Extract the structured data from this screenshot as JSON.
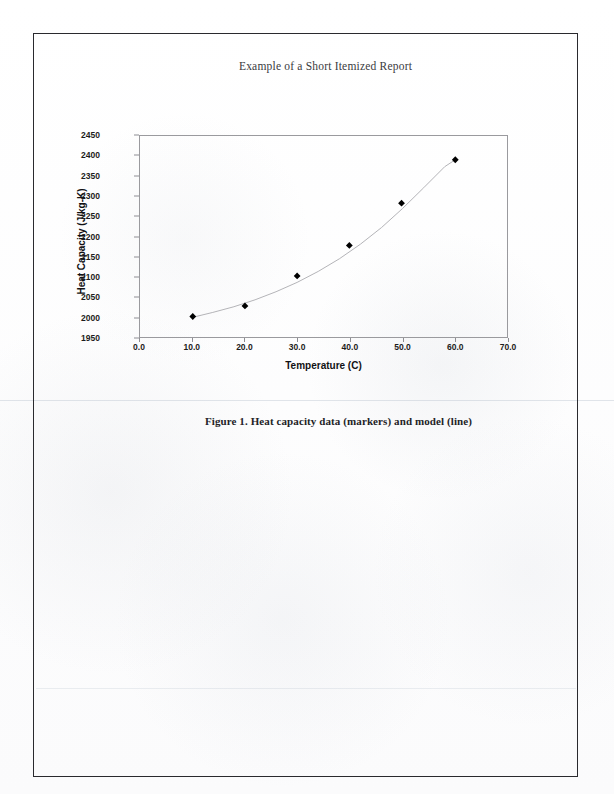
{
  "document": {
    "page_border_color": "#2a2a2e",
    "background_color": "#fdfdfd"
  },
  "figure": {
    "caption": "Figure 1. Heat capacity data (markers) and model (line)"
  },
  "chart_data": {
    "type": "scatter",
    "title": "Example of a Short Itemized Report",
    "xlabel": "Temperature (C)",
    "ylabel": "Heat Capacity (J/kg-K)",
    "xlim": [
      0.0,
      70.0
    ],
    "ylim": [
      1950,
      2450
    ],
    "xticks": [
      "0.0",
      "10.0",
      "20.0",
      "30.0",
      "40.0",
      "50.0",
      "60.0",
      "70.0"
    ],
    "xtick_values": [
      0,
      10,
      20,
      30,
      40,
      50,
      60,
      70
    ],
    "yticks": [
      "1950",
      "2000",
      "2050",
      "2100",
      "2150",
      "2200",
      "2250",
      "2300",
      "2350",
      "2400",
      "2450"
    ],
    "ytick_values": [
      1950,
      2000,
      2050,
      2100,
      2150,
      2200,
      2250,
      2300,
      2350,
      2400,
      2450
    ],
    "grid": false,
    "legend": null,
    "marker_color": "#000000",
    "line_color": "#b0b0b4",
    "marker_shape": "diamond",
    "series": [
      {
        "name": "Heat capacity data",
        "render": "markers",
        "x": [
          10.2,
          20.1,
          30.0,
          39.9,
          49.8,
          60.0
        ],
        "y": [
          2003,
          2029,
          2103,
          2178,
          2282,
          2389
        ]
      },
      {
        "name": "Model",
        "render": "line",
        "x": [
          10.2,
          14,
          18,
          22,
          26,
          30,
          34,
          38,
          42,
          46,
          50,
          54,
          58,
          60.0
        ],
        "y": [
          2001,
          2013,
          2027,
          2044,
          2064,
          2087,
          2114,
          2145,
          2181,
          2222,
          2269,
          2320,
          2372,
          2389
        ]
      }
    ]
  }
}
